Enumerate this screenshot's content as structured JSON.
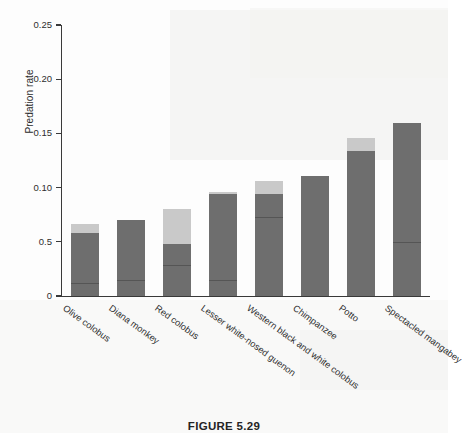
{
  "figure": {
    "caption": "FIGURE 5.29"
  },
  "chart_data": {
    "type": "bar",
    "title": "",
    "xlabel": "",
    "ylabel": "Predation rate",
    "ylim": [
      0,
      0.25
    ],
    "grid": false,
    "legend": false,
    "stacked": true,
    "ytick_labels": [
      "0.25",
      "0.20",
      "0.15",
      "0.10",
      "0.5",
      "0"
    ],
    "ytick_values": [
      0.25,
      0.2,
      0.15,
      0.1,
      0.05,
      0
    ],
    "categories": [
      "Olive colobus",
      "Diana monkey",
      "Red colobus",
      "Lesser white-nosed guenon",
      "Western black and white colobus",
      "Chimpanzee",
      "Potto",
      "Spectacled mangabey"
    ],
    "series": [
      {
        "name": "lower-segment",
        "color": "#6e6e6e",
        "values": [
          0.058,
          0.07,
          0.048,
          0.094,
          0.094,
          0.111,
          0.134,
          0.16
        ]
      },
      {
        "name": "upper-segment",
        "color": "#c9c9c9",
        "values": [
          0.008,
          0.0,
          0.032,
          0.002,
          0.012,
          0.0,
          0.012,
          0.0
        ]
      }
    ],
    "totals": [
      0.066,
      0.07,
      0.08,
      0.096,
      0.106,
      0.111,
      0.146,
      0.16
    ],
    "inner_rules": [
      0.011,
      0.014,
      0.028,
      0.014,
      0.072,
      null,
      null,
      0.049
    ]
  }
}
